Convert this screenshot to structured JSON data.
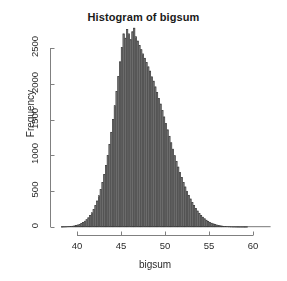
{
  "chart_data": {
    "type": "bar",
    "title": "Histogram of bigsum",
    "xlabel": "bigsum",
    "ylabel": "Frequency",
    "xlim": [
      38.2,
      62.0
    ],
    "ylim": [
      0,
      2800
    ],
    "xticks": [
      40,
      45,
      50,
      55,
      60
    ],
    "yticks": [
      0,
      500,
      1000,
      1500,
      2000,
      2500
    ],
    "xtick_labels": [
      "40",
      "45",
      "50",
      "55",
      "60"
    ],
    "ytick_labels": [
      "0",
      "500",
      "1000",
      "1500",
      "2000",
      "2500"
    ],
    "grid": false,
    "legend": false,
    "bin_width": 0.2,
    "bar_fill": "#8c8c8c",
    "bar_edge": "#3d3d3d",
    "axis_color": "#808080",
    "bin_starts": [
      38.2,
      38.4,
      38.6,
      38.8,
      39.0,
      39.2,
      39.4,
      39.6,
      39.8,
      40.0,
      40.2,
      40.4,
      40.6,
      40.8,
      41.0,
      41.2,
      41.4,
      41.6,
      41.8,
      42.0,
      42.2,
      42.4,
      42.6,
      42.8,
      43.0,
      43.2,
      43.4,
      43.6,
      43.8,
      44.0,
      44.2,
      44.4,
      44.6,
      44.8,
      45.0,
      45.2,
      45.4,
      45.6,
      45.8,
      46.0,
      46.2,
      46.4,
      46.6,
      46.8,
      47.0,
      47.2,
      47.4,
      47.6,
      47.8,
      48.0,
      48.2,
      48.4,
      48.6,
      48.8,
      49.0,
      49.2,
      49.4,
      49.6,
      49.8,
      50.0,
      50.2,
      50.4,
      50.6,
      50.8,
      51.0,
      51.2,
      51.4,
      51.6,
      51.8,
      52.0,
      52.2,
      52.4,
      52.6,
      52.8,
      53.0,
      53.2,
      53.4,
      53.6,
      53.8,
      54.0,
      54.2,
      54.4,
      54.6,
      54.8,
      55.0,
      55.2,
      55.4,
      55.6,
      55.8,
      56.0,
      56.2,
      56.4,
      56.6,
      56.8,
      57.0,
      57.2,
      57.4,
      57.6,
      57.8,
      58.0,
      58.2,
      58.4,
      58.6,
      58.8,
      59.0,
      59.2,
      59.4,
      59.6,
      59.8,
      60.0,
      60.2,
      60.4,
      60.6,
      60.8,
      61.0,
      61.2,
      61.4,
      61.6,
      61.8
    ],
    "counts": [
      2,
      3,
      4,
      6,
      8,
      11,
      14,
      18,
      24,
      31,
      40,
      52,
      66,
      84,
      106,
      132,
      164,
      202,
      248,
      302,
      366,
      440,
      527,
      626,
      738,
      864,
      1004,
      1158,
      1326,
      1506,
      1698,
      1898,
      2104,
      2310,
      2512,
      2700,
      2640,
      2760,
      2700,
      2620,
      2730,
      2780,
      2660,
      2600,
      2540,
      2480,
      2420,
      2360,
      2300,
      2240,
      2180,
      2100,
      2040,
      1960,
      1880,
      1800,
      1720,
      1630,
      1540,
      1450,
      1360,
      1270,
      1180,
      1090,
      1000,
      920,
      840,
      766,
      694,
      626,
      562,
      502,
      446,
      394,
      346,
      302,
      262,
      226,
      194,
      166,
      140,
      118,
      98,
      82,
      68,
      56,
      46,
      37,
      30,
      24,
      19,
      15,
      12,
      9,
      7,
      6,
      4,
      3,
      3,
      2,
      2,
      1,
      1,
      1,
      1,
      1,
      0,
      0,
      0,
      0,
      0,
      0,
      0,
      0,
      0,
      0,
      0,
      0,
      0
    ],
    "peak": {
      "x": 49.9,
      "y": 2780
    },
    "distribution": "approximately normal, mean around 50"
  },
  "axes": {
    "x_axis_start_value": 40,
    "x_axis_end_value": 60,
    "y_axis_start_value": 0,
    "y_axis_end_value": 2500
  }
}
